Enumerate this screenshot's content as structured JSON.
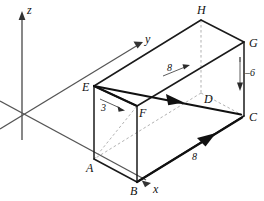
{
  "figure": {
    "type": "3d-box-vector-diagram",
    "background_color": "#ffffff",
    "ink_color": "#1a1a1a",
    "hidden_edge_color": "#9a9a9a",
    "axes": {
      "z": {
        "label": "z",
        "label_x": 27,
        "label_y": 14
      },
      "y": {
        "label": "y",
        "label_x": 145,
        "label_y": 43
      },
      "x": {
        "label": "x",
        "label_x": 153,
        "label_y": 193
      }
    },
    "vertices": [
      {
        "name": "A",
        "label": "A",
        "x": 94,
        "y": 159,
        "label_x": 86,
        "label_y": 172
      },
      {
        "name": "B",
        "label": "B",
        "x": 137,
        "y": 182,
        "label_x": 130,
        "label_y": 195
      },
      {
        "name": "C",
        "label": "C",
        "x": 244,
        "y": 116,
        "label_x": 249,
        "label_y": 121
      },
      {
        "name": "D",
        "label": "D",
        "x": 201,
        "y": 93,
        "label_x": 204,
        "label_y": 103
      },
      {
        "name": "E",
        "label": "E",
        "x": 94,
        "y": 86,
        "label_x": 84,
        "label_y": 91
      },
      {
        "name": "F",
        "label": "F",
        "x": 137,
        "y": 106,
        "label_x": 139,
        "label_y": 116
      },
      {
        "name": "G",
        "label": "G",
        "x": 244,
        "y": 42,
        "label_x": 249,
        "label_y": 47
      },
      {
        "name": "H",
        "label": "H",
        "x": 201,
        "y": 20,
        "label_x": 198,
        "label_y": 14
      }
    ],
    "measures": [
      {
        "id": "edge-ef-length",
        "value": "3",
        "x": 105,
        "y": 110
      },
      {
        "id": "edge-top-length",
        "value": "8",
        "x": 171,
        "y": 70
      },
      {
        "id": "edge-bc-length",
        "value": "8",
        "x": 196,
        "y": 158
      },
      {
        "id": "vertical-drop",
        "value": "–6",
        "x": 248,
        "y": 75
      }
    ]
  }
}
